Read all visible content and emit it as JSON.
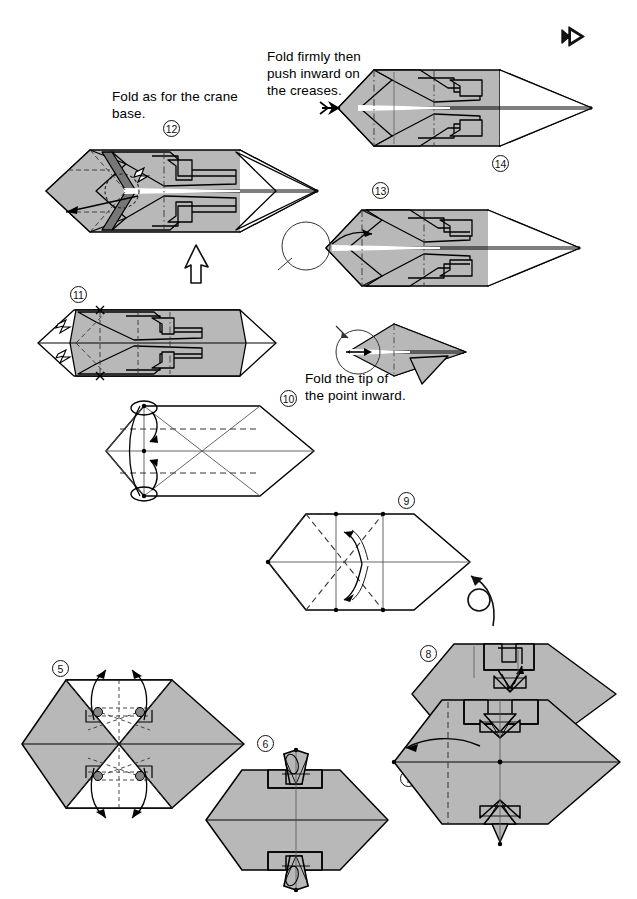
{
  "page": {
    "width": 637,
    "height": 899,
    "background": "#ffffff",
    "paper_front_color": "#b8b8b8",
    "paper_back_color": "#ffffff",
    "line_color": "#000000"
  },
  "captions": [
    {
      "id": "caption-crane-base",
      "text": "Fold as for the crane\nbase.",
      "x": 112,
      "y": 88
    },
    {
      "id": "caption-fold-firmly",
      "text": "Fold firmly then\npush inward on\nthe creases.",
      "x": 267,
      "y": 48
    },
    {
      "id": "caption-fold-tip",
      "text": "Fold the tip of\nthe point inward.",
      "x": 305,
      "y": 370
    }
  ],
  "steps": [
    {
      "number": "5",
      "label_x": 52,
      "label_y": 660,
      "diagram": "hexagon-with-white-flaps-and-spread-arrows"
    },
    {
      "number": "6",
      "label_x": 257,
      "label_y": 735,
      "diagram": "gray-hexagon-with-top-bottom-points"
    },
    {
      "number": "7",
      "label_x": 400,
      "label_y": 770,
      "diagram": "large-gray-hexagon-with-fold-arrow"
    },
    {
      "number": "8",
      "label_x": 420,
      "label_y": 645,
      "diagram": "upper-gray-hexagon-with-notched-top"
    },
    {
      "number": "9",
      "label_x": 398,
      "label_y": 492,
      "diagram": "hexagon-with-diagonal-creases-and-curved-arrows"
    },
    {
      "number": "10",
      "label_x": 280,
      "label_y": 390,
      "diagram": "hexagon-with-horizontal-creases-and-loop-arrows"
    },
    {
      "number": "11",
      "label_x": 70,
      "label_y": 286,
      "diagram": "elongated-hexagon-with-inner-pleats"
    },
    {
      "number": "12",
      "label_x": 163,
      "label_y": 120,
      "diagram": "elongated-form-with-push-arrow"
    },
    {
      "number": "13",
      "label_x": 372,
      "label_y": 182,
      "diagram": "elongated-form-with-detail-circle"
    },
    {
      "number": "14",
      "label_x": 492,
      "label_y": 155,
      "diagram": "completed-elongated-form"
    }
  ],
  "symbols": [
    {
      "id": "page-turn-arrow",
      "name": "page-turn-arrow-icon",
      "x": 562,
      "y": 28
    },
    {
      "id": "progress-arrow-up",
      "name": "hollow-up-arrow-icon",
      "x": 193,
      "y": 248
    },
    {
      "id": "turn-over-arrow",
      "name": "turn-over-rotation-arrow-icon",
      "x": 468,
      "y": 570
    },
    {
      "id": "detail-circle-13",
      "name": "detail-magnifier-circle",
      "x": 303,
      "y": 243
    },
    {
      "id": "detail-circle-tip",
      "name": "detail-magnifier-circle",
      "x": 355,
      "y": 350
    }
  ],
  "legend": {
    "valley_fold": "dashed line",
    "mountain_fold": "dash-dot line",
    "fold_arrow": "solid arrow",
    "push_here": "arrow with filled head"
  }
}
